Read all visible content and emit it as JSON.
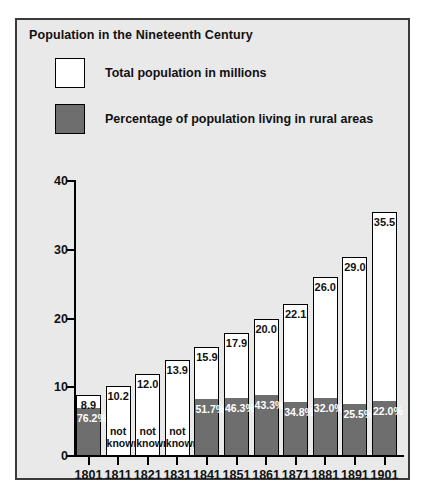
{
  "figure": {
    "title": "Population in the Nineteenth Century",
    "panel_bg": "#e9e9e9",
    "border_color": "#3a3a3a"
  },
  "legend": {
    "position": "top-left",
    "entries": [
      {
        "label": "Total population in millions",
        "color": "#ffffff",
        "swatch": "white-square-swatch"
      },
      {
        "label": "Percentage of population living in rural areas",
        "color": "#6e6e6e",
        "swatch": "gray-square-swatch"
      }
    ]
  },
  "axes": {
    "y_ticks": [
      "0",
      "10",
      "20",
      "30",
      "40"
    ],
    "y_tick_values": [
      0,
      10,
      20,
      30,
      40
    ],
    "ylim": [
      0,
      40
    ],
    "grid": "off"
  },
  "chart_data": {
    "type": "bar",
    "title": "Population in the Nineteenth Century",
    "xlabel": "",
    "ylabel": "",
    "ylim": [
      0,
      40
    ],
    "grid": false,
    "legend_position": "top-left",
    "categories": [
      "1801",
      "1811",
      "1821",
      "1831",
      "1841",
      "1851",
      "1861",
      "1871",
      "1881",
      "1891",
      "1901"
    ],
    "series": [
      {
        "name": "Total population in millions",
        "color": "#ffffff",
        "values": [
          8.9,
          10.2,
          12.0,
          13.9,
          15.9,
          17.9,
          20.0,
          22.1,
          26.0,
          29.0,
          35.5
        ],
        "labels": [
          "8.9",
          "10.2",
          "12.0",
          "13.9",
          "15.9",
          "17.9",
          "20.0",
          "22.1",
          "26.0",
          "29.0",
          "35.5"
        ]
      },
      {
        "name": "Percentage of population living in rural areas",
        "color": "#6e6e6e",
        "values": [
          76.2,
          null,
          null,
          null,
          51.7,
          46.3,
          43.3,
          34.8,
          32.0,
          25.5,
          22.0
        ],
        "labels": [
          "76.2%",
          "not known",
          "not known",
          "not known",
          "51.7%",
          "46.3%",
          "43.3%",
          "34.8%",
          "32.0%",
          "25.5%",
          "22.0%"
        ]
      }
    ],
    "unknown_text_line1": "not",
    "unknown_text_line2": "known"
  }
}
